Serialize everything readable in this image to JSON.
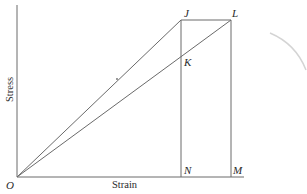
{
  "diagram": {
    "axes": {
      "x_label": "Strain",
      "y_label": "Stress",
      "origin_label": "O"
    },
    "points": {
      "J": "J",
      "K": "K",
      "L": "L",
      "M": "M",
      "N": "N"
    },
    "colors": {
      "line": "#6a6a6a",
      "text": "#2a2a2a",
      "arc": "#d4d4d4"
    }
  }
}
